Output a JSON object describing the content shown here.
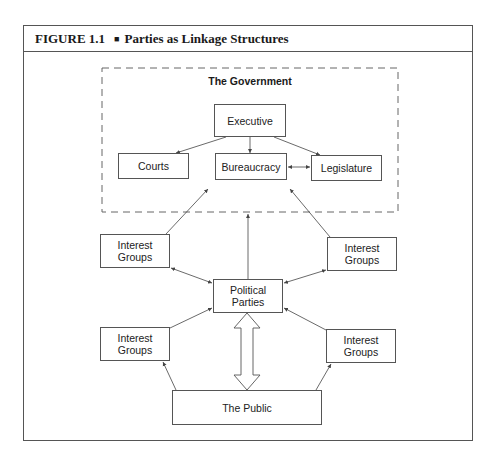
{
  "figure": {
    "number": "FIGURE 1.1",
    "separator": "■",
    "title": "Parties as Linkage Structures"
  },
  "government": {
    "label": "The Government",
    "executive": "Executive",
    "courts": "Courts",
    "bureaucracy": "Bureaucracy",
    "legislature": "Legislature"
  },
  "interest_groups": {
    "upper_left": "Interest Groups",
    "upper_right": "Interest Groups",
    "lower_left": "Interest Groups",
    "lower_right": "Interest Groups"
  },
  "political_parties": "Political Parties",
  "public": "The Public",
  "colors": {
    "line": "#555555",
    "text": "#222222",
    "background": "#ffffff"
  }
}
